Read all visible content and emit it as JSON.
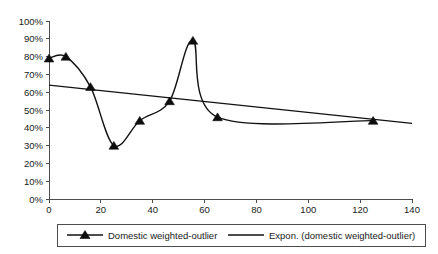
{
  "chart_data": {
    "type": "line",
    "title": "",
    "xlabel": "",
    "ylabel": "",
    "xlim": [
      0,
      140
    ],
    "ylim": [
      0,
      1.0
    ],
    "grid": false,
    "legend_position": "bottom",
    "x_ticks": [
      "0",
      "20",
      "40",
      "60",
      "80",
      "100",
      "120",
      "140"
    ],
    "x_tick_values": [
      0,
      20,
      40,
      60,
      80,
      100,
      120,
      140
    ],
    "y_ticks": [
      "0%",
      "10%",
      "20%",
      "30%",
      "40%",
      "50%",
      "60%",
      "70%",
      "80%",
      "90%",
      "100%"
    ],
    "y_tick_values": [
      0,
      10,
      20,
      30,
      40,
      50,
      60,
      70,
      80,
      90,
      100
    ],
    "series": [
      {
        "name": "Domestic weighted-outlier",
        "marker": "triangle",
        "color": "#111111",
        "x": [
          0,
          6.5,
          16,
          25,
          35,
          46.5,
          55.5,
          65,
          125
        ],
        "values": [
          79,
          80,
          63,
          30,
          44,
          55,
          89,
          46,
          44
        ]
      },
      {
        "name": "Expon. (domestic weighted-outlier)",
        "marker": "none",
        "color": "#111111",
        "trendline": true,
        "x": [
          0,
          140
        ],
        "values": [
          64,
          42.5
        ]
      }
    ],
    "legend": [
      {
        "label": "Domestic weighted-outlier",
        "marker": "triangle-line"
      },
      {
        "label": "Expon. (domestic weighted-outlier)",
        "marker": "line"
      }
    ]
  }
}
